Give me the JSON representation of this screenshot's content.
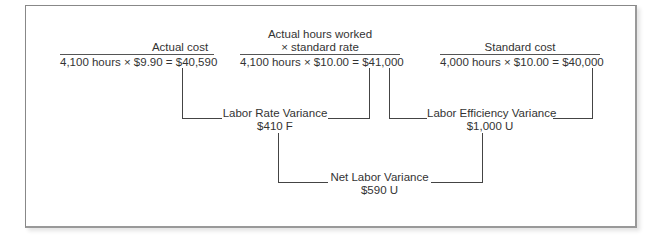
{
  "columns": [
    {
      "header_lines": [
        "Actual cost"
      ],
      "formula": "4,100 hours × $9.90 = $40,590"
    },
    {
      "header_lines": [
        "Actual hours worked",
        "× standard rate"
      ],
      "formula": "4,100 hours × $10.00 = $41,000"
    },
    {
      "header_lines": [
        "Standard cost"
      ],
      "formula": "4,000 hours × $10.00 = $40,000"
    }
  ],
  "variances": {
    "rate": {
      "label": "Labor Rate Variance",
      "value": "$410 F"
    },
    "efficiency": {
      "label": "Labor Efficiency Variance",
      "value": "$1,000 U"
    },
    "net": {
      "label": "Net Labor Variance",
      "value": "$590 U"
    }
  }
}
